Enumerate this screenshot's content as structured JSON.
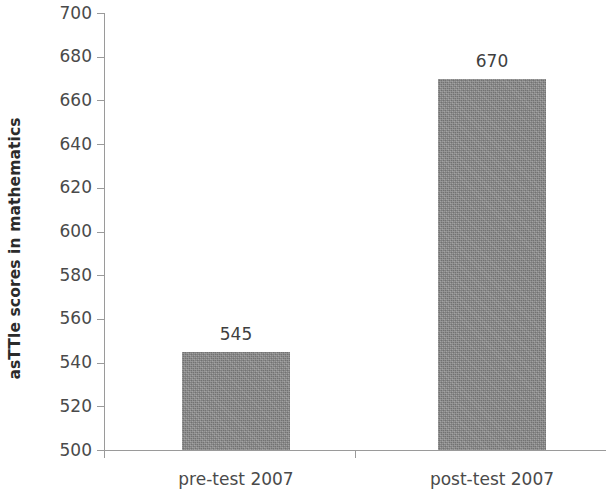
{
  "chart_data": {
    "type": "bar",
    "title": "",
    "subtitle": "",
    "xlabel": "",
    "ylabel": "asTTle scores in mathematics",
    "categories": [
      "pre-test 2007",
      "post-test 2007"
    ],
    "values": [
      545,
      670
    ],
    "data_labels": [
      "545",
      "670"
    ],
    "ylim": [
      500,
      700
    ],
    "ytick_step": 20,
    "ytick_labels": [
      "700",
      "680",
      "660",
      "640",
      "620",
      "600",
      "580",
      "560",
      "540",
      "520",
      "500"
    ],
    "ytick_values": [
      700,
      680,
      660,
      640,
      620,
      600,
      580,
      560,
      540,
      520,
      500
    ],
    "grid": false,
    "legend": false,
    "legend_position": "none",
    "bar_color": "#8a8a8a",
    "axis_color": "#9a9a9a",
    "text_color": "#4a4a4a"
  }
}
